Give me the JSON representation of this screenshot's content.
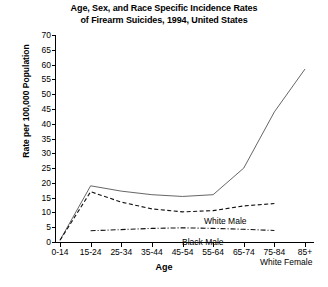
{
  "chart_data": {
    "type": "line",
    "title": "Age, Sex, and Race Specific Incidence Rates of Firearm Suicides, 1994, United States",
    "title_line1": "Age, Sex, and Race Specific Incidence Rates",
    "title_line2": "of Firearm Suicides, 1994, United States",
    "xlabel": "Age",
    "ylabel": "Rate per 100,000 Population",
    "categories": [
      "0-14",
      "15-24",
      "25-34",
      "35-44",
      "45-54",
      "55-64",
      "65-74",
      "75-84",
      "85+"
    ],
    "ylim": [
      0,
      70
    ],
    "yticks": [
      0,
      5,
      10,
      15,
      20,
      25,
      30,
      35,
      40,
      45,
      50,
      55,
      60,
      65,
      70
    ],
    "grid": false,
    "legend": "inline-labels",
    "series": [
      {
        "name": "White Male",
        "style": "solid",
        "color": "#555555",
        "values": [
          0.6,
          19.0,
          17.2,
          16.0,
          15.4,
          16.0,
          25.0,
          44.0,
          58.5
        ]
      },
      {
        "name": "Black Male",
        "style": "dashed",
        "color": "#111111",
        "values": [
          0.6,
          17.0,
          13.5,
          11.2,
          10.2,
          10.6,
          12.2,
          13.0,
          null
        ]
      },
      {
        "name": "White Female",
        "style": "dash-dot",
        "color": "#111111",
        "values": [
          null,
          3.8,
          4.2,
          4.6,
          4.8,
          4.6,
          4.3,
          3.9,
          null
        ]
      }
    ]
  },
  "labels": {
    "white_male": "White Male",
    "black_male": "Black Male",
    "white_female": "White Female"
  }
}
